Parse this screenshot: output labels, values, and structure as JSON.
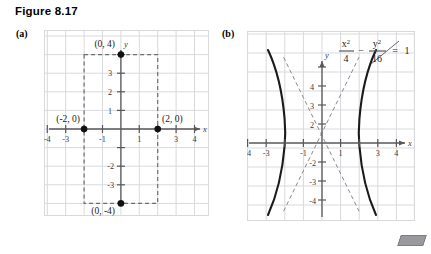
{
  "figure": {
    "title": "Figure 8.17",
    "corner_mark": "gray-parallelogram"
  },
  "panels": [
    {
      "id": "a",
      "label": "(a)",
      "axis_x_name": "x",
      "axis_y_name": "y",
      "x_tick_labels": [
        "-4",
        "-3",
        "-1",
        "1",
        "3",
        "4"
      ],
      "y_tick_labels": [
        "3",
        "2",
        "1",
        "-2",
        "-3"
      ],
      "point_labels": [
        "(0, 4)",
        "(-2, 0)",
        "(2, 0)",
        "(0, -4)"
      ],
      "points": [
        {
          "label": "(0, 4)",
          "x": 0,
          "y": 4
        },
        {
          "label": "(-2, 0)",
          "x": -2,
          "y": 0
        },
        {
          "label": "(2, 0)",
          "x": 2,
          "y": 0
        },
        {
          "label": "(0, -4)",
          "x": 0,
          "y": -4
        }
      ]
    },
    {
      "id": "b",
      "label": "(b)",
      "axis_x_name": "x",
      "axis_y_name": "y",
      "x_tick_labels": [
        "-4",
        "-3",
        "-1",
        "1",
        "3",
        "4"
      ],
      "y_tick_labels": [
        "4",
        "3",
        "2",
        "-2",
        "-3",
        "-4"
      ],
      "equation": {
        "num1": "x",
        "sup1": "2",
        "den1": "4",
        "op": "−",
        "num2": "y",
        "sup2": "2",
        "den2": "16",
        "equals": "=",
        "rhs": "1"
      }
    }
  ],
  "chart_data": [
    {
      "type": "scatter",
      "panel": "a",
      "title": "",
      "xlabel": "x",
      "ylabel": "y",
      "xlim": [
        -4.6,
        4.6
      ],
      "ylim": [
        -5.0,
        5.0
      ],
      "xticks": [
        -4,
        -3,
        -1,
        1,
        3,
        4
      ],
      "yticks": [
        3,
        2,
        1,
        -2,
        -3
      ],
      "grid": true,
      "points": [
        {
          "x": 0,
          "y": 4,
          "label": "(0, 4)"
        },
        {
          "x": -2,
          "y": 0,
          "label": "(-2, 0)"
        },
        {
          "x": 2,
          "y": 0,
          "label": "(2, 0)"
        },
        {
          "x": 0,
          "y": -4,
          "label": "(0, -4)"
        }
      ],
      "annotations": [
        {
          "kind": "dashed-rectangle",
          "x1": -2,
          "y1": -4,
          "x2": 2,
          "y2": 4
        }
      ]
    },
    {
      "type": "line",
      "panel": "b",
      "title": "x^2/4 - y^2/16 = 1",
      "xlabel": "x",
      "ylabel": "y",
      "xlim": [
        -4.6,
        4.6
      ],
      "ylim": [
        -5.0,
        5.0
      ],
      "xticks": [
        -4,
        -3,
        -1,
        1,
        3,
        4
      ],
      "yticks": [
        4,
        3,
        2,
        -2,
        -3,
        -4
      ],
      "grid": true,
      "series": [
        {
          "name": "hyperbola-right-branch",
          "style": "solid",
          "equation": "x = 2*sqrt(1 + y^2/16)",
          "vertex": [
            2,
            0
          ]
        },
        {
          "name": "hyperbola-left-branch",
          "style": "solid",
          "equation": "x = -2*sqrt(1 + y^2/16)",
          "vertex": [
            -2,
            0
          ]
        },
        {
          "name": "asymptote-positive",
          "style": "dashed",
          "equation": "y = 2x"
        },
        {
          "name": "asymptote-negative",
          "style": "dashed",
          "equation": "y = -2x"
        }
      ],
      "annotations": [
        {
          "kind": "leader-line",
          "text": "x^2/4 - y^2/16 = 1"
        }
      ]
    }
  ]
}
